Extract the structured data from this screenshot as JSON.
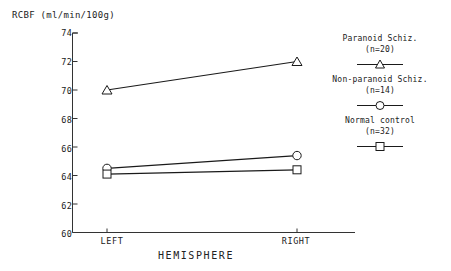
{
  "chart_data": {
    "type": "line",
    "title": "",
    "xlabel": "HEMISPHERE",
    "ylabel": "RCBF (ml/min/100g)",
    "categories": [
      "LEFT",
      "RIGHT"
    ],
    "ylim": [
      60,
      74
    ],
    "yticks": [
      60,
      62,
      64,
      66,
      68,
      70,
      72,
      74
    ],
    "ytick_labels": [
      "60",
      "62",
      "64",
      "66",
      "68",
      "70",
      "72",
      "74"
    ],
    "grid": false,
    "legend_position": "right",
    "series": [
      {
        "name": "Paranoid Schiz.",
        "n_label": "(n=20)",
        "n": 20,
        "marker": "triangle",
        "color": "#1a1a1a",
        "values": [
          70.0,
          72.0
        ]
      },
      {
        "name": "Non-paranoid Schiz.",
        "n_label": "(n=14)",
        "n": 14,
        "marker": "circle",
        "color": "#1a1a1a",
        "values": [
          64.5,
          65.4
        ]
      },
      {
        "name": "Normal control",
        "n_label": "(n=32)",
        "n": 32,
        "marker": "square",
        "color": "#1a1a1a",
        "values": [
          64.1,
          64.4
        ]
      }
    ]
  },
  "axes": {
    "y_title": "RCBF (ml/min/100g)",
    "x_title": "HEMISPHERE",
    "y_tick_0": "74",
    "y_tick_1": "72",
    "y_tick_2": "70",
    "y_tick_3": "68",
    "y_tick_4": "66",
    "y_tick_5": "64",
    "y_tick_6": "62",
    "y_tick_7": "60",
    "x_tick_left": "LEFT",
    "x_tick_right": "RIGHT"
  },
  "legend": {
    "entries": [
      {
        "label": "Paranoid Schiz.",
        "n_label": "(n=20)",
        "marker": "triangle"
      },
      {
        "label": "Non-paranoid Schiz.",
        "n_label": "(n=14)",
        "marker": "circle"
      },
      {
        "label": "Normal control",
        "n_label": "(n=32)",
        "marker": "square"
      }
    ]
  }
}
